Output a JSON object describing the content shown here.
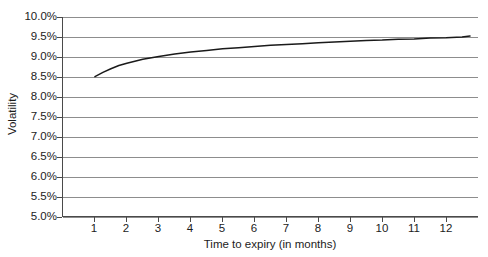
{
  "chart_data": {
    "type": "line",
    "title": "",
    "xlabel": "Time to expiry (in months)",
    "ylabel": "Volatility",
    "xlim": [
      0.0,
      13.0
    ],
    "ylim": [
      5.0,
      10.0
    ],
    "grid": true,
    "legend": false,
    "x_tick_labels": [
      "1",
      "2",
      "3",
      "4",
      "5",
      "6",
      "7",
      "8",
      "9",
      "10",
      "11",
      "12"
    ],
    "x_ticks": [
      1,
      2,
      3,
      4,
      5,
      6,
      7,
      8,
      9,
      10,
      11,
      12
    ],
    "y_tick_labels": [
      "10.0%",
      "9.5%",
      "9.0%",
      "8.5%",
      "8.0%",
      "7.5%",
      "7.0%",
      "6.5%",
      "6.0%",
      "5.5%",
      "5.0%"
    ],
    "y_ticks": [
      10.0,
      9.5,
      9.0,
      8.5,
      8.0,
      7.5,
      7.0,
      6.5,
      6.0,
      5.5,
      5.0
    ],
    "series": [
      {
        "name": "Volatility term structure",
        "color": "#1a1a1a",
        "x": [
          1.0,
          1.25,
          1.5,
          1.75,
          2.0,
          2.5,
          3.0,
          3.5,
          4.0,
          4.5,
          5.0,
          5.5,
          6.0,
          6.5,
          7.0,
          7.5,
          8.0,
          8.5,
          9.0,
          9.5,
          10.0,
          10.5,
          11.0,
          11.5,
          12.0,
          12.5,
          12.75
        ],
        "values": [
          8.5,
          8.61,
          8.7,
          8.78,
          8.84,
          8.94,
          9.01,
          9.07,
          9.12,
          9.16,
          9.2,
          9.23,
          9.26,
          9.29,
          9.31,
          9.33,
          9.35,
          9.37,
          9.39,
          9.41,
          9.42,
          9.44,
          9.45,
          9.47,
          9.48,
          9.5,
          9.52
        ]
      }
    ]
  },
  "axes": {
    "x_title": "Time to expiry (in months)",
    "y_title": "Volatility"
  }
}
